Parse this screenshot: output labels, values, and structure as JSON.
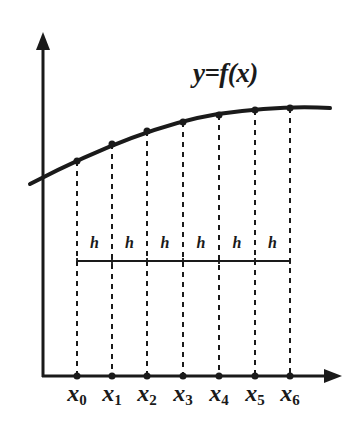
{
  "title": "y=f(x)",
  "colors": {
    "ink": "#1a1a1a",
    "background": "#ffffff"
  },
  "axes": {
    "origin": [
      43,
      376
    ],
    "y_axis_top": [
      43,
      32
    ],
    "x_axis_end": [
      342,
      376
    ]
  },
  "curve": {
    "label": "y=f(x)",
    "path": "M30,184 C 80,158 150,125 218,114 C 260,108 300,106 330,108"
  },
  "nodes": [
    {
      "label": "x",
      "sub": "0",
      "x": 77,
      "y": 161
    },
    {
      "label": "x",
      "sub": "1",
      "x": 112,
      "y": 144
    },
    {
      "label": "x",
      "sub": "2",
      "x": 147,
      "y": 131
    },
    {
      "label": "x",
      "sub": "3",
      "x": 183,
      "y": 122
    },
    {
      "label": "x",
      "sub": "4",
      "x": 219,
      "y": 115
    },
    {
      "label": "x",
      "sub": "5",
      "x": 255,
      "y": 110
    },
    {
      "label": "x",
      "sub": "6",
      "x": 290,
      "y": 108
    }
  ],
  "step": {
    "label": "h",
    "line_y": 261,
    "labels": [
      "h",
      "h",
      "h",
      "h",
      "h",
      "h"
    ]
  }
}
